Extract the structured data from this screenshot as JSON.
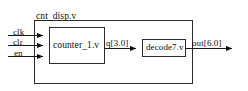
{
  "diagram": {
    "type": "block-diagram",
    "title": "cnt_disp.v",
    "top_module": {
      "name": "cnt_disp.v",
      "box": {
        "x": 34,
        "y": 20,
        "w": 159,
        "h": 64
      }
    },
    "inputs": [
      {
        "name": "clk",
        "label": "clk",
        "y": 35
      },
      {
        "name": "clr",
        "label": "clr",
        "y": 45
      },
      {
        "name": "en",
        "label": "en",
        "y": 56
      }
    ],
    "submodules": [
      {
        "id": "counter",
        "label": "counter_1.v",
        "box": {
          "x": 49,
          "y": 27,
          "w": 56,
          "h": 37
        }
      },
      {
        "id": "decoder",
        "label": "decode7.v",
        "box": {
          "x": 142,
          "y": 39,
          "w": 44,
          "h": 18
        }
      }
    ],
    "internal_nets": [
      {
        "name": "q",
        "label": "q[3.0]",
        "from": "counter",
        "to": "decoder",
        "y": 48
      }
    ],
    "outputs": [
      {
        "name": "out",
        "label": "out[6.0]",
        "y": 48
      }
    ],
    "colors": {
      "line": "#1a1a1a",
      "box_border": "#2b2b2b",
      "background": "#ffffff",
      "text": "#0d0d0d"
    }
  }
}
